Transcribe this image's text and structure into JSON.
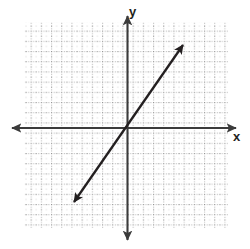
{
  "figure": {
    "width": 250,
    "height": 249,
    "background_color": "#ffffff",
    "title": ""
  },
  "axes": {
    "x_label": "x",
    "y_label": "y",
    "axis_color": "#3b3b3b",
    "origin_px": [
      127,
      128
    ],
    "x_axis_left_tip_px": [
      12,
      128
    ],
    "x_axis_right_tip_px": [
      236,
      128
    ],
    "y_axis_top_tip_px": [
      127,
      16
    ],
    "y_axis_bottom_tip_px": [
      128,
      240
    ],
    "arrowheads": [
      "left",
      "right",
      "up",
      "down"
    ],
    "tick_labels_shown": false
  },
  "grid": {
    "color": "#9a9a9a",
    "style": "dotted",
    "left_px": 24,
    "top_px": 22,
    "right_px": 228,
    "bottom_px": 228,
    "cell_px": 10.2,
    "columns": 20,
    "rows": 20,
    "visible": true
  },
  "chart_data": {
    "type": "line",
    "title": "",
    "xlabel": "x",
    "ylabel": "y",
    "grid": true,
    "legend_position": "none",
    "xlim": [
      -10,
      10
    ],
    "ylim": [
      -10,
      10
    ],
    "annotations": [],
    "series": [
      {
        "name": "line",
        "style": "double-headed-arrow",
        "color": "#231f20",
        "slope": 1.44,
        "intercept": 0,
        "passes_through_origin": true,
        "x": [
          -5.2,
          5.5
        ],
        "y": [
          -7.25,
          8.14
        ],
        "endpoints_px": [
          [
            74,
            202
          ],
          [
            183,
            45
          ]
        ],
        "arrow_start": true,
        "arrow_end": true
      }
    ]
  }
}
